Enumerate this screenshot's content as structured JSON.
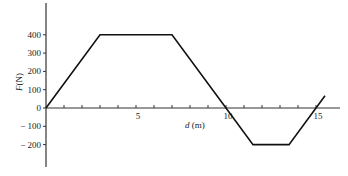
{
  "chart_data": {
    "type": "line",
    "title": "",
    "xlabel": "d (m)",
    "ylabel": "F(N)",
    "x_tick_labels": [
      "5",
      "10",
      "15"
    ],
    "x_minor_ticks": [
      1,
      2,
      3,
      4,
      5,
      6,
      7,
      8,
      9,
      10,
      11,
      12,
      13,
      14,
      15
    ],
    "y_tick_labels": [
      "400",
      "300",
      "200",
      "100",
      "0",
      "-100",
      "-200"
    ],
    "y_ticks": [
      400,
      300,
      200,
      100,
      0,
      -100,
      -200
    ],
    "xlim": [
      0,
      16
    ],
    "ylim": [
      -300,
      500
    ],
    "grid": false,
    "legend": null,
    "series": [
      {
        "name": "F(d)",
        "color": "#111111",
        "x": [
          0,
          3,
          7,
          10,
          11.5,
          13.5,
          15,
          15.5
        ],
        "y": [
          0,
          400,
          400,
          0,
          -200,
          -200,
          0,
          67
        ]
      }
    ]
  },
  "labels": {
    "xlabel_italic": "d",
    "xlabel_unit": " (m)",
    "ylabel_italic": "F",
    "ylabel_unit": "(N)"
  }
}
